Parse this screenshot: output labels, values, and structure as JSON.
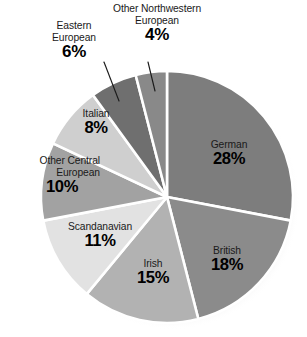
{
  "chart_data": {
    "type": "pie",
    "title": "",
    "subtitle": "",
    "xlabel": "",
    "ylabel": "",
    "legend_position": "none",
    "grid": false,
    "value_suffix": "%",
    "total": 100,
    "start_angle_deg": 0,
    "direction": "clockwise",
    "categories": [
      "German",
      "British",
      "Irish",
      "Scandanavian",
      "Other Central European",
      "Italian",
      "Eastern European",
      "Other Northwestern European"
    ],
    "values": [
      28,
      18,
      15,
      11,
      10,
      8,
      6,
      4
    ],
    "slices": [
      {
        "label": "German",
        "label_lines": [
          "German"
        ],
        "value": 28,
        "value_text": "28%",
        "color": "#7d7d7d",
        "label_placement": "inside",
        "leader_line": false
      },
      {
        "label": "British",
        "label_lines": [
          "British"
        ],
        "value": 18,
        "value_text": "18%",
        "color": "#8b8b8b",
        "label_placement": "inside",
        "leader_line": false
      },
      {
        "label": "Irish",
        "label_lines": [
          "Irish"
        ],
        "value": 15,
        "value_text": "15%",
        "color": "#b2b2b2",
        "label_placement": "inside",
        "leader_line": false
      },
      {
        "label": "Scandanavian",
        "label_lines": [
          "Scandanavian"
        ],
        "value": 11,
        "value_text": "11%",
        "color": "#e2e2e2",
        "label_placement": "inside",
        "leader_line": false
      },
      {
        "label": "Other Central European",
        "label_lines": [
          "Other Central",
          "European"
        ],
        "value": 10,
        "value_text": "10%",
        "color": "#a2a2a2",
        "label_placement": "inside",
        "leader_line": false
      },
      {
        "label": "Italian",
        "label_lines": [
          "Italian"
        ],
        "value": 8,
        "value_text": "8%",
        "color": "#cfcfcf",
        "label_placement": "inside",
        "leader_line": false
      },
      {
        "label": "Eastern European",
        "label_lines": [
          "Eastern",
          "European"
        ],
        "value": 6,
        "value_text": "6%",
        "color": "#6f6f6f",
        "label_placement": "outside",
        "leader_line": true
      },
      {
        "label": "Other Northwestern European",
        "label_lines": [
          "Other Northwestern",
          "European"
        ],
        "value": 4,
        "value_text": "4%",
        "color": "#898989",
        "label_placement": "outside",
        "leader_line": true
      }
    ],
    "colors": {
      "separator": "#ffffff",
      "leader_line": "#1b1b1b",
      "label_text": "#1a1a1a",
      "value_text": "#000000",
      "background": "#ffffff"
    }
  },
  "labels": {
    "german": {
      "name": "German",
      "pct": "28%"
    },
    "british": {
      "name": "British",
      "pct": "18%"
    },
    "irish": {
      "name": "Irish",
      "pct": "15%"
    },
    "scandanavian": {
      "name": "Scandanavian",
      "pct": "11%"
    },
    "other_central": {
      "name_line1": "Other Central",
      "name_line2": "European",
      "pct": "10%"
    },
    "italian": {
      "name": "Italian",
      "pct": "8%"
    },
    "eastern": {
      "name_line1": "Eastern",
      "name_line2": "European",
      "pct": "6%"
    },
    "other_northwest": {
      "name_line1": "Other Northwestern",
      "name_line2": "European",
      "pct": "4%"
    }
  }
}
